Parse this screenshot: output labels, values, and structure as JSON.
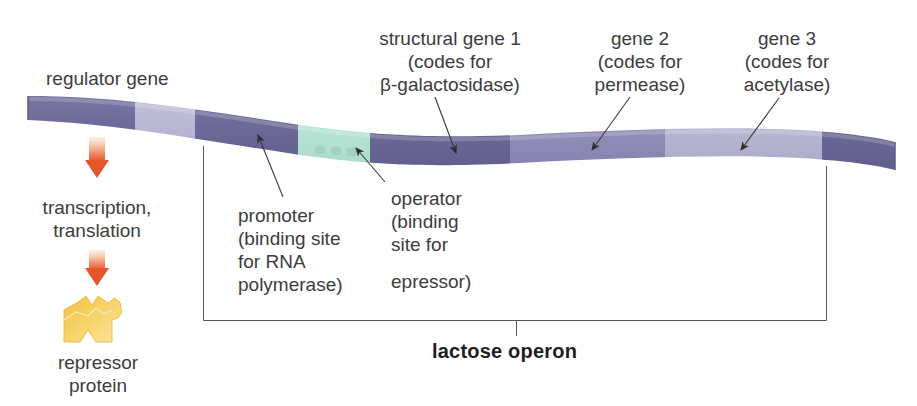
{
  "figure": {
    "title": "lactose operon",
    "colors": {
      "dna_dark": "#6e6a98",
      "dna_medium": "#8e8bb5",
      "dna_light": "#b7b5d2",
      "operator_teal": "#b9e3d6",
      "arrow_orange": "#ea5f35",
      "repressor_yellow": "#f6cc55",
      "line": "#555555",
      "text": "#3c3c3c"
    }
  },
  "labels": {
    "regulator_gene": "regulator gene",
    "transcription": [
      "transcription,",
      "translation"
    ],
    "repressor": [
      "repressor",
      "protein"
    ],
    "promoter": [
      "promoter",
      "(binding site",
      "for RNA",
      "polymerase)"
    ],
    "operator": [
      "operator",
      "(binding",
      "site for",
      "",
      "epressor)"
    ],
    "gene1": [
      "structural gene 1",
      "(codes for",
      "β-galactosidase)"
    ],
    "gene2": [
      "gene 2",
      "(codes for",
      "permease)"
    ],
    "gene3": [
      "gene 3",
      "(codes for",
      "acetylase)"
    ]
  },
  "dna_segments": [
    {
      "name": "regulator-gene",
      "shade": "dark"
    },
    {
      "name": "spacer",
      "shade": "light"
    },
    {
      "name": "promoter",
      "shade": "dark"
    },
    {
      "name": "operator",
      "shade": "teal"
    },
    {
      "name": "structural-gene-1",
      "shade": "dark"
    },
    {
      "name": "gene-2",
      "shade": "medium"
    },
    {
      "name": "gene-3",
      "shade": "light"
    },
    {
      "name": "downstream",
      "shade": "dark"
    }
  ]
}
